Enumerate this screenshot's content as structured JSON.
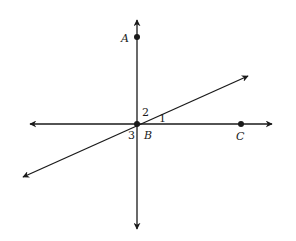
{
  "diagram": {
    "type": "geometry-intersecting-lines",
    "colors": {
      "line": "#1a1a1a",
      "background": "#ffffff"
    },
    "points": [
      {
        "name": "A",
        "label": "A",
        "x": 137,
        "y": 37
      },
      {
        "name": "B",
        "label": "B",
        "x": 137,
        "y": 124
      },
      {
        "name": "C",
        "label": "C",
        "x": 241,
        "y": 124
      }
    ],
    "lines": [
      {
        "name": "vertical-line",
        "x1": 137,
        "y1": 16,
        "x2": 137,
        "y2": 233,
        "arrows": "both"
      },
      {
        "name": "horizontal-line",
        "x1": 26,
        "y1": 124,
        "x2": 276,
        "y2": 124,
        "arrows": "both"
      },
      {
        "name": "diagonal-line",
        "x1": 19,
        "y1": 179,
        "x2": 252,
        "y2": 74,
        "arrows": "both"
      }
    ],
    "angle_labels": [
      {
        "name": "angle-1",
        "label": "1"
      },
      {
        "name": "angle-2",
        "label": "2"
      },
      {
        "name": "angle-3",
        "label": "3"
      }
    ]
  }
}
